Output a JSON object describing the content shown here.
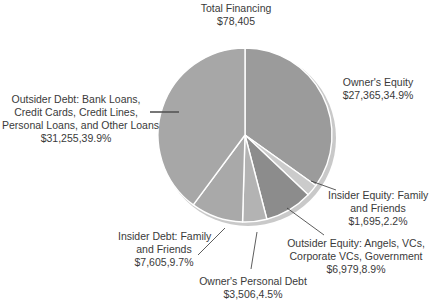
{
  "chart_data": {
    "type": "pie",
    "title": "Total Financing",
    "total_label": "$78,405",
    "total": 78405,
    "start_angle_deg": 0,
    "direction": "clockwise",
    "slices": [
      {
        "name": "Owner's Equity",
        "label_lines": [
          "Owner's Equity"
        ],
        "value": 27365,
        "value_label": "$27,365,34.9%",
        "percent": 34.9,
        "color": "#9b9b9b"
      },
      {
        "name": "Insider Equity: Family and Friends",
        "label_lines": [
          "Insider Equity: Family",
          "and Friends"
        ],
        "value": 1695,
        "value_label": "$1,695,2.2%",
        "percent": 2.2,
        "color": "#cbcbcb"
      },
      {
        "name": "Outsider Equity: Angels, VCs, Corporate VCs, Government",
        "label_lines": [
          "Outsider Equity: Angels, VCs,",
          "Corporate VCs, Government"
        ],
        "value": 6979,
        "value_label": "$6,979,8.9%",
        "percent": 8.9,
        "color": "#8c8c8c"
      },
      {
        "name": "Owner's Personal Debt",
        "label_lines": [
          "Owner's Personal Debt"
        ],
        "value": 3506,
        "value_label": "$3,506,4.5%",
        "percent": 4.5,
        "color": "#b3b3b3"
      },
      {
        "name": "Insider Debt: Family and Friends",
        "label_lines": [
          "Insider Debt: Family",
          "and Friends"
        ],
        "value": 7605,
        "value_label": "$7,605,9.7%",
        "percent": 9.7,
        "color": "#a9a9a9"
      },
      {
        "name": "Outsider Debt: Bank Loans, Credit Cards, Credit Lines, Personal Loans, and Other Loans",
        "label_lines": [
          "Outsider Debt: Bank Loans,",
          "Credit Cards, Credit Lines,",
          "Personal Loans, and Other Loans"
        ],
        "value": 31255,
        "value_label": "$31,255,39.9%",
        "percent": 39.9,
        "color": "#a7a7a7"
      }
    ],
    "legend": "none",
    "grid": false
  },
  "labels": {
    "title": {
      "line1": "Total Financing",
      "line2": "$78,405"
    },
    "owners_equity": {
      "line1": "Owner's Equity",
      "value": "$27,365,34.9%"
    },
    "insider_equity": {
      "line1": "Insider Equity: Family",
      "line2": "and Friends",
      "value": "$1,695,2.2%"
    },
    "outsider_equity": {
      "line1": "Outsider Equity: Angels, VCs,",
      "line2": "Corporate VCs, Government",
      "value": "$6,979,8.9%"
    },
    "owners_personal_debt": {
      "line1": "Owner's Personal Debt",
      "value": "$3,506,4.5%"
    },
    "insider_debt": {
      "line1": "Insider Debt: Family",
      "line2": "and Friends",
      "value": "$7,605,9.7%"
    },
    "outsider_debt": {
      "line1": "Outsider Debt: Bank Loans,",
      "line2": "Credit Cards, Credit Lines,",
      "line3": "Personal Loans, and Other Loans",
      "value": "$31,255,39.9%"
    }
  }
}
